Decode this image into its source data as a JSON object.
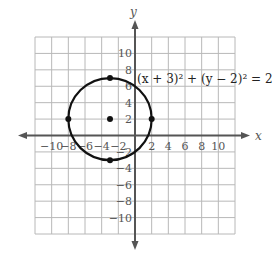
{
  "chart_data": {
    "type": "scatter",
    "title": "",
    "xlabel": "x",
    "ylabel": "y",
    "xlim": [
      -12,
      12
    ],
    "ylim": [
      -12,
      12
    ],
    "grid": true,
    "grid_step": 2,
    "x_ticks": [
      "-10",
      "-8",
      "-6",
      "-4",
      "-2",
      "2",
      "4",
      "6",
      "8",
      "10"
    ],
    "y_ticks": [
      "10",
      "8",
      "6",
      "4",
      "2",
      "-2",
      "-4",
      "-6",
      "-8",
      "-10"
    ],
    "circle": {
      "center": [
        -3,
        2
      ],
      "radius": 5
    },
    "points": [
      {
        "x": -3,
        "y": 2,
        "label": "center"
      },
      {
        "x": -3,
        "y": 7,
        "label": "top"
      },
      {
        "x": -3,
        "y": -3,
        "label": "bottom"
      },
      {
        "x": -8,
        "y": 2,
        "label": "left"
      },
      {
        "x": 2,
        "y": 2,
        "label": "right"
      }
    ],
    "annotations": [
      {
        "text": "(x + 3)² + (y − 2)² = 25",
        "x": 0.5,
        "y": 7
      }
    ]
  },
  "labels": {
    "x_axis": "x",
    "y_axis": "y",
    "equation": "(x + 3)² + (y − 2)² = 25"
  },
  "colors": {
    "grid": "#b8b8b8",
    "axis": "#555555",
    "curve": "#111111"
  }
}
